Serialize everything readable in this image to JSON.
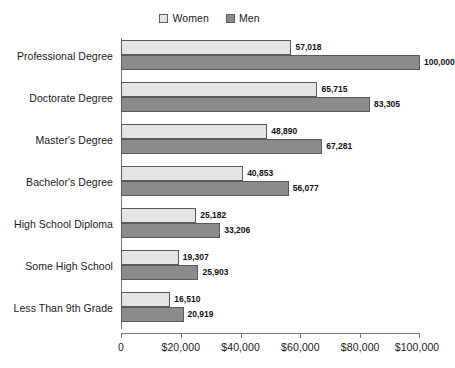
{
  "legend": {
    "position": "top-center",
    "entries": [
      {
        "label": "Women",
        "color": "#e4e4e4",
        "swatch_name": "legend-swatch-women"
      },
      {
        "label": "Men",
        "color": "#8b8b8b",
        "swatch_name": "legend-swatch-men"
      }
    ]
  },
  "axis": {
    "ticks": [
      {
        "label": "0",
        "value": 0
      },
      {
        "label": "$20,000",
        "value": 20000
      },
      {
        "label": "$40,000",
        "value": 40000
      },
      {
        "label": "$60,000",
        "value": 60000
      },
      {
        "label": "$80,000",
        "value": 80000
      },
      {
        "label": "$100,000",
        "value": 100000
      }
    ]
  },
  "chart_data": {
    "type": "bar",
    "orientation": "horizontal",
    "grouped": true,
    "title": "",
    "xlabel": "",
    "ylabel": "",
    "xlim": [
      0,
      100000
    ],
    "grid": false,
    "legend_position": "top-center",
    "categories": [
      "Professional Degree",
      "Doctorate Degree",
      "Master's Degree",
      "Bachelor's Degree",
      "High School Diploma",
      "Some High School",
      "Less Than 9th Grade"
    ],
    "series": [
      {
        "name": "Women",
        "color": "#e4e4e4",
        "values": [
          57018,
          65715,
          48890,
          40853,
          25182,
          19307,
          16510
        ],
        "labels": [
          "57,018",
          "65,715",
          "48,890",
          "40,853",
          "25,182",
          "19,307",
          "16,510"
        ]
      },
      {
        "name": "Men",
        "color": "#8b8b8b",
        "values": [
          100000,
          83305,
          67281,
          56077,
          33206,
          25903,
          20919
        ],
        "labels": [
          "100,000",
          "83,305",
          "67,281",
          "56,077",
          "33,206",
          "25,903",
          "20,919"
        ]
      }
    ]
  }
}
